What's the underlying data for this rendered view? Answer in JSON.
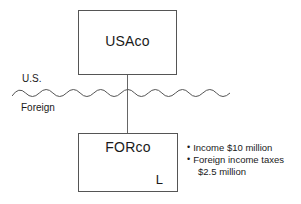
{
  "diagram": {
    "parent": {
      "name": "USAco"
    },
    "subsidiary": {
      "name": "FORco",
      "annotation": "L"
    },
    "border": {
      "upper_label": "U.S.",
      "lower_label": "Foreign",
      "divider": "wavy-border-line"
    },
    "connector": "ownership-line",
    "notes": [
      {
        "bullet": "•",
        "text": "Income $10 million"
      },
      {
        "bullet": "•",
        "text": "Foreign income taxes"
      }
    ],
    "note_continuation": "$2.5 million"
  },
  "colors": {
    "background": "#ffffff",
    "box_border": "#555555",
    "line": "#666666",
    "text": "#1a1a1a"
  }
}
